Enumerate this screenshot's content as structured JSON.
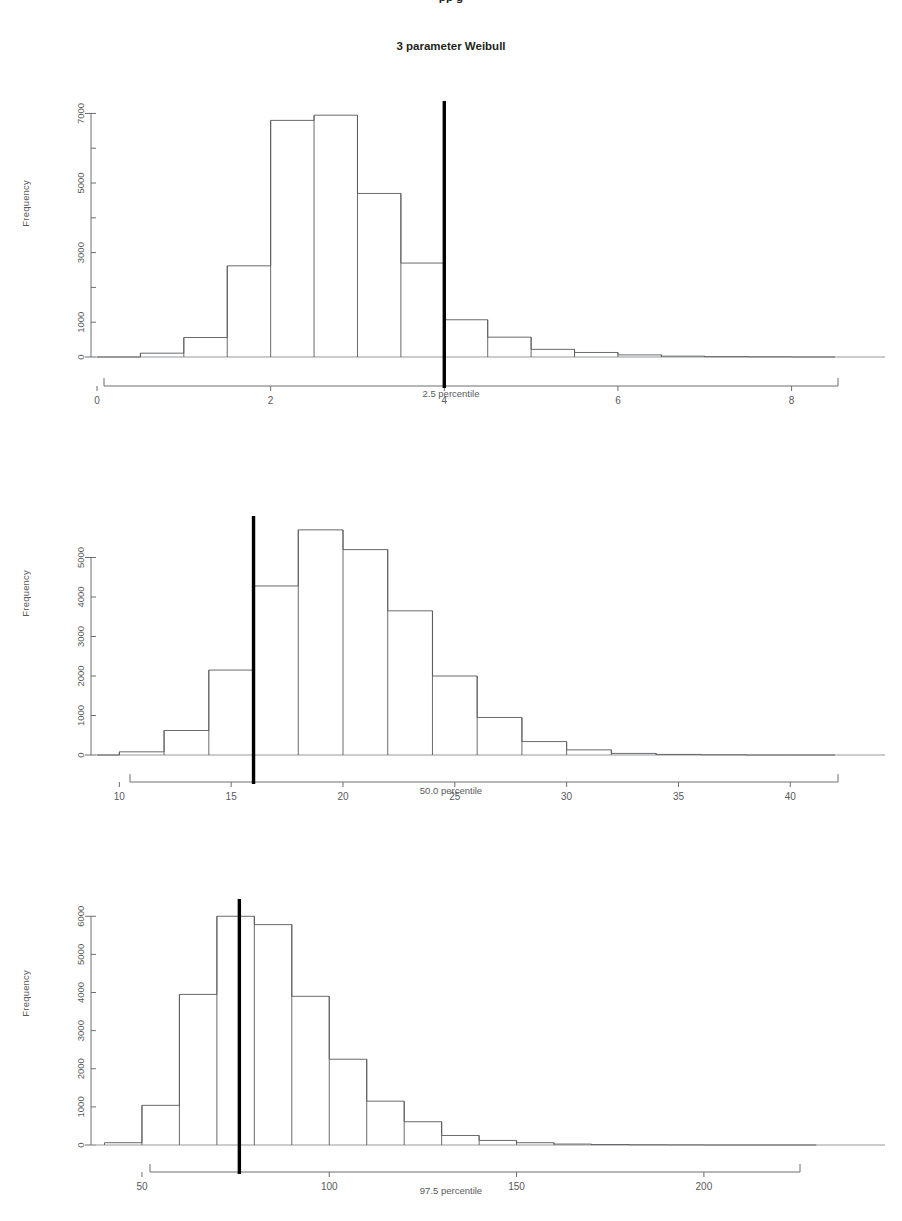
{
  "top_cut_text": "pp g",
  "figure": {
    "title": "3 parameter Weibull",
    "ylabel": "Frequency"
  },
  "panels": [
    {
      "name": "panel-2-5-percentile",
      "xlabel": "2.5 percentile",
      "ylabel": "Frequency"
    },
    {
      "name": "panel-50-0-percentile",
      "xlabel": "50.0 percentile",
      "ylabel": "Frequency"
    },
    {
      "name": "panel-97-5-percentile",
      "xlabel": "97.5 percentile",
      "ylabel": "Frequency"
    }
  ],
  "chart_data": [
    {
      "type": "bar",
      "subtype": "histogram",
      "title": "3 parameter Weibull",
      "xlabel": "2.5 percentile",
      "ylabel": "Frequency",
      "xlim": [
        0,
        8.5
      ],
      "ylim": [
        0,
        7300
      ],
      "grid": false,
      "legend": null,
      "xticks": [
        0,
        2,
        4,
        6,
        8
      ],
      "yticks": [
        0,
        1000,
        2000,
        3000,
        4000,
        5000,
        6000,
        7000
      ],
      "ytick_labels": [
        "0",
        "1000",
        "",
        "3000",
        "",
        "5000",
        "",
        "7000"
      ],
      "bin_width": 0.5,
      "bin_edges": [
        0.0,
        0.5,
        1.0,
        1.5,
        2.0,
        2.5,
        3.0,
        3.5,
        4.0,
        4.5,
        5.0,
        5.5,
        6.0,
        6.5,
        7.0,
        7.5,
        8.0,
        8.5
      ],
      "values": [
        0,
        110,
        560,
        2620,
        6800,
        6950,
        4700,
        2700,
        1070,
        570,
        220,
        130,
        60,
        25,
        10,
        5,
        0
      ],
      "reference_line": {
        "x": 4.0,
        "color": "#000000",
        "width": 3.4
      }
    },
    {
      "type": "bar",
      "subtype": "histogram",
      "title": "",
      "xlabel": "50.0 percentile",
      "ylabel": "Frequency",
      "xlim": [
        9,
        42
      ],
      "ylim": [
        0,
        6000
      ],
      "grid": false,
      "legend": null,
      "xticks": [
        10,
        15,
        20,
        25,
        30,
        35,
        40
      ],
      "yticks": [
        0,
        1000,
        2000,
        3000,
        4000,
        5000
      ],
      "ytick_labels": [
        "0",
        "1000",
        "2000",
        "3000",
        "4000",
        "5000"
      ],
      "bin_width": 2,
      "bin_edges": [
        9,
        10,
        12,
        14,
        16,
        18,
        20,
        22,
        24,
        26,
        28,
        30,
        32,
        34,
        36,
        38,
        40,
        42
      ],
      "values": [
        0,
        80,
        620,
        2150,
        4280,
        5700,
        5200,
        3650,
        2000,
        950,
        340,
        130,
        40,
        15,
        5,
        0,
        0
      ],
      "reference_line": {
        "x": 16,
        "color": "#000000",
        "width": 3.4
      }
    },
    {
      "type": "bar",
      "subtype": "histogram",
      "title": "",
      "xlabel": "97.5 percentile",
      "ylabel": "Frequency",
      "xlim": [
        38,
        235
      ],
      "ylim": [
        0,
        6400
      ],
      "grid": false,
      "legend": null,
      "xticks": [
        50,
        100,
        150,
        200
      ],
      "yticks": [
        0,
        1000,
        2000,
        3000,
        4000,
        5000,
        6000
      ],
      "ytick_labels": [
        "0",
        "1000",
        "2000",
        "3000",
        "4000",
        "5000",
        "6000"
      ],
      "bin_width": 10,
      "bin_edges": [
        40,
        50,
        60,
        70,
        80,
        90,
        100,
        110,
        120,
        130,
        140,
        150,
        160,
        170,
        180,
        190,
        200,
        210,
        220,
        230
      ],
      "values": [
        60,
        1040,
        3950,
        6000,
        5780,
        3900,
        2250,
        1150,
        610,
        250,
        120,
        60,
        25,
        12,
        6,
        3,
        0,
        0,
        0
      ],
      "reference_line": {
        "x": 76,
        "color": "#000000",
        "width": 3.4
      }
    }
  ]
}
